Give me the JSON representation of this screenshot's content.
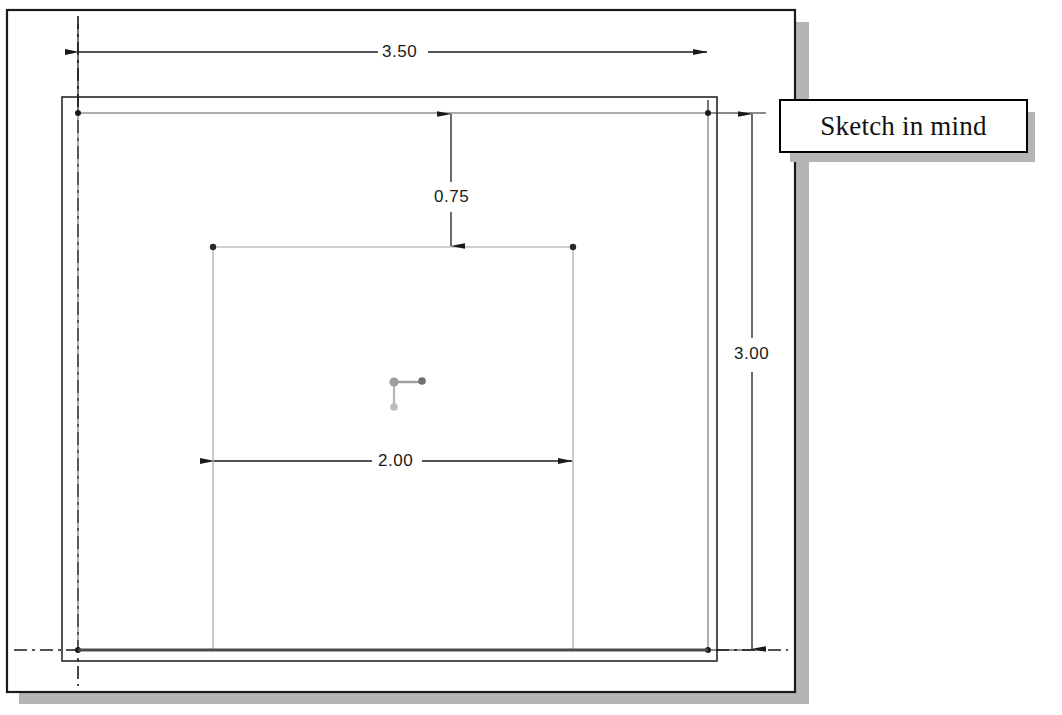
{
  "app": {
    "title": "Sketch in mind",
    "kind": "cad-sketch-viewport"
  },
  "callout": {
    "label": "Sketch in mind"
  },
  "colors": {
    "line_dark": "#1a1a1a",
    "line_light": "#9a9a9a",
    "shadow_gray": "#b5b5b5",
    "origin_gray": "#9d9d9d",
    "origin_dark": "#6f6f6f",
    "background": "#ffffff"
  },
  "dimensions": [
    {
      "id": "width-overall",
      "value": "3.50",
      "orientation": "horizontal",
      "label_x": 402,
      "label_y": 52
    },
    {
      "id": "offset-top",
      "value": "0.75",
      "orientation": "vertical",
      "label_x": 451,
      "label_y": 198
    },
    {
      "id": "height-overall",
      "value": "3.00",
      "orientation": "vertical",
      "label_x": 752,
      "label_y": 355
    },
    {
      "id": "width-inner",
      "value": "2.00",
      "orientation": "horizontal",
      "label_x": 396,
      "label_y": 461
    }
  ],
  "geometry": {
    "outer_frame": {
      "x": 7,
      "y": 10,
      "w": 788,
      "h": 682
    },
    "mid_rect": {
      "x": 62,
      "y": 97,
      "w": 655,
      "h": 564
    },
    "sketch_rect": {
      "x": 78,
      "y": 113,
      "w": 630,
      "h": 537
    },
    "inner_rect": {
      "x": 213,
      "y": 247,
      "w": 360,
      "h": 403
    },
    "origin": {
      "x": 394,
      "y": 382
    }
  },
  "icons": {
    "origin": "origin-axis-icon",
    "arrow": "dimension-arrow-icon"
  }
}
